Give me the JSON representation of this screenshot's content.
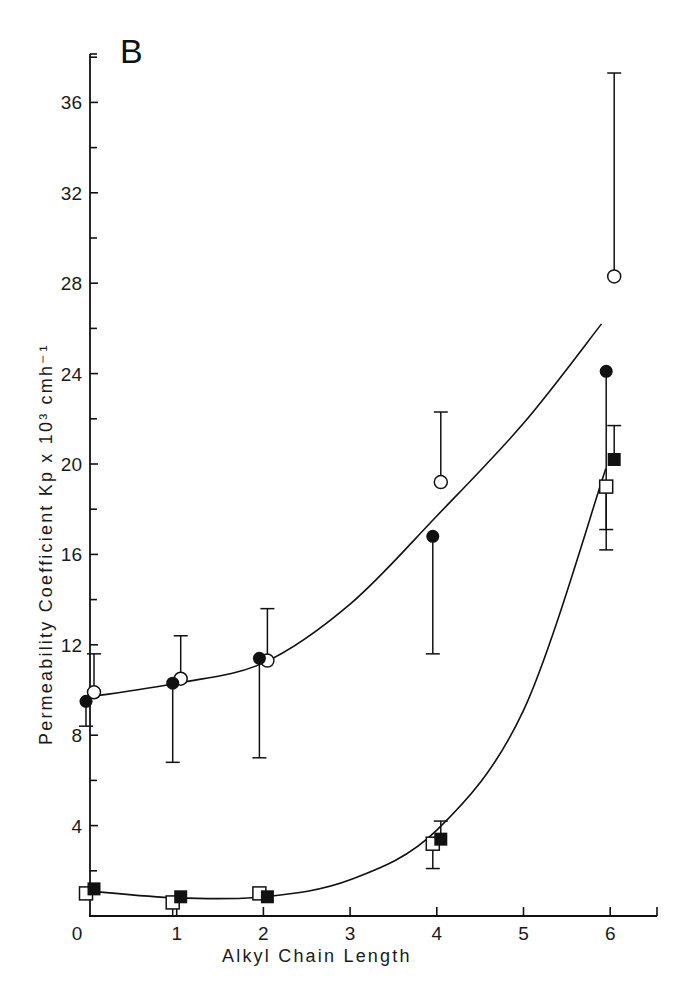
{
  "chart_data": {
    "type": "scatter",
    "panel_label": "B",
    "title": "",
    "xlabel": "Alkyl Chain Length",
    "ylabel": "Permeability Coefficient Kp x 10³ cmh⁻¹",
    "xlim": [
      0,
      6.5
    ],
    "ylim": [
      0,
      38
    ],
    "x_ticks": [
      0,
      1,
      2,
      3,
      4,
      5,
      6
    ],
    "x_tick_labels": [
      "0",
      "1",
      "2",
      "3",
      "4",
      "5",
      "6"
    ],
    "y_ticks_major": [
      4,
      8,
      12,
      16,
      20,
      24,
      28,
      32,
      36
    ],
    "y_tick_labels": [
      "4",
      "8",
      "12",
      "16",
      "20",
      "24",
      "28",
      "32",
      "36"
    ],
    "y_ticks_minor": [
      2,
      6,
      10,
      14,
      18,
      22,
      26,
      30,
      34,
      38
    ],
    "grid": false,
    "legend": null,
    "series": [
      {
        "name": "open circles",
        "marker": "open-circle",
        "x": [
          0,
          1,
          2,
          4,
          6
        ],
        "values": [
          9.9,
          10.5,
          11.3,
          19.2,
          28.3
        ],
        "error_upper": [
          11.6,
          12.4,
          13.6,
          22.3,
          37.3
        ],
        "error_lower": [
          null,
          null,
          null,
          null,
          null
        ]
      },
      {
        "name": "filled circles",
        "marker": "filled-circle",
        "x": [
          0,
          1,
          2,
          4,
          6
        ],
        "values": [
          9.5,
          10.3,
          11.4,
          16.8,
          24.1
        ],
        "error_upper": [
          null,
          null,
          null,
          null,
          null
        ],
        "error_lower": [
          8.4,
          6.8,
          7.0,
          11.6,
          16.2
        ]
      },
      {
        "name": "open squares",
        "marker": "open-square",
        "x": [
          0,
          1,
          2,
          4,
          6
        ],
        "values": [
          1.0,
          0.6,
          1.0,
          3.2,
          19.0
        ],
        "error_upper": [
          null,
          null,
          null,
          null,
          null
        ],
        "error_lower": [
          null,
          0.0,
          null,
          2.1,
          17.1
        ]
      },
      {
        "name": "filled squares",
        "marker": "filled-square",
        "x": [
          0,
          1,
          2,
          4,
          6
        ],
        "values": [
          1.2,
          0.85,
          0.85,
          3.4,
          20.2
        ],
        "error_upper": [
          null,
          null,
          null,
          4.2,
          21.7
        ],
        "error_lower": [
          null,
          null,
          null,
          null,
          null
        ]
      }
    ],
    "fit_curves": [
      {
        "name": "circles fit",
        "x": [
          0,
          1,
          2,
          3,
          4,
          5,
          5.9
        ],
        "values": [
          9.7,
          10.3,
          11.2,
          13.8,
          17.7,
          21.8,
          26.2
        ]
      },
      {
        "name": "squares fit",
        "x": [
          0,
          1,
          2,
          3,
          4,
          5,
          5.95
        ],
        "values": [
          1.1,
          0.8,
          0.85,
          1.6,
          3.8,
          9.1,
          19.8
        ]
      }
    ]
  }
}
